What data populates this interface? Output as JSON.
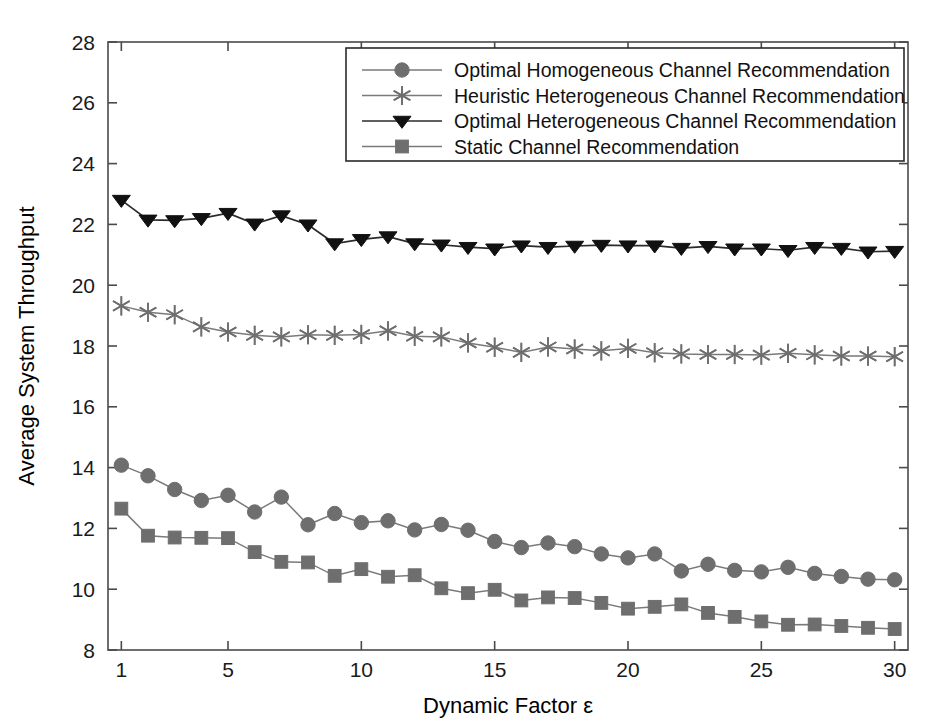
{
  "chart_data": {
    "type": "line",
    "title": "",
    "xlabel": "Dynamic Factor ε",
    "ylabel": "Average System Throughput",
    "xlim": [
      0.5,
      30.5
    ],
    "ylim": [
      8,
      28
    ],
    "xticks": [
      1,
      5,
      10,
      15,
      20,
      25,
      30
    ],
    "xticklabels": [
      "1",
      "5",
      "10",
      "15",
      "20",
      "25",
      "30"
    ],
    "yticks": [
      8,
      10,
      12,
      14,
      16,
      18,
      20,
      22,
      24,
      26,
      28
    ],
    "yticklabels": [
      "8",
      "10",
      "12",
      "14",
      "16",
      "18",
      "20",
      "22",
      "24",
      "26",
      "28"
    ],
    "grid": false,
    "legend_position": "upper center",
    "x": [
      1,
      2,
      3,
      4,
      5,
      6,
      7,
      8,
      9,
      10,
      11,
      12,
      13,
      14,
      15,
      16,
      17,
      18,
      19,
      20,
      21,
      22,
      23,
      24,
      25,
      26,
      27,
      28,
      29,
      30
    ],
    "series": [
      {
        "name": "Optimal Homogeneous Channel Recommendation",
        "marker": "circle",
        "marker_color": "#6e6e6e",
        "line_color": "#7a7a7a",
        "values": [
          14.08,
          13.73,
          13.28,
          12.92,
          13.09,
          12.54,
          13.03,
          12.12,
          12.49,
          12.19,
          12.25,
          11.95,
          12.13,
          11.94,
          11.57,
          11.37,
          11.52,
          11.4,
          11.16,
          11.03,
          11.16,
          10.6,
          10.82,
          10.62,
          10.57,
          10.72,
          10.52,
          10.42,
          10.33,
          10.31
        ]
      },
      {
        "name": "Heuristic Heterogeneous Channel Recommendation",
        "marker": "star",
        "marker_color": "#6e6e6e",
        "line_color": "#7a7a7a",
        "values": [
          19.32,
          19.11,
          19.03,
          18.63,
          18.46,
          18.35,
          18.3,
          18.37,
          18.35,
          18.38,
          18.5,
          18.32,
          18.3,
          18.1,
          17.96,
          17.79,
          17.97,
          17.9,
          17.84,
          17.92,
          17.78,
          17.74,
          17.72,
          17.72,
          17.7,
          17.76,
          17.71,
          17.67,
          17.67,
          17.65
        ]
      },
      {
        "name": "Optimal Heterogeneous Channel Recommendation",
        "marker": "triangle-down",
        "marker_color": "#111111",
        "line_color": "#2b2b2b",
        "values": [
          22.8,
          22.15,
          22.13,
          22.2,
          22.37,
          22.02,
          22.29,
          21.99,
          21.37,
          21.51,
          21.6,
          21.37,
          21.33,
          21.25,
          21.2,
          21.3,
          21.25,
          21.29,
          21.32,
          21.3,
          21.3,
          21.22,
          21.28,
          21.2,
          21.2,
          21.15,
          21.25,
          21.22,
          21.1,
          21.12
        ]
      },
      {
        "name": "Static Channel Recommendation",
        "marker": "square",
        "marker_color": "#6e6e6e",
        "line_color": "#7a7a7a",
        "values": [
          12.65,
          11.76,
          11.7,
          11.69,
          11.68,
          11.22,
          10.9,
          10.88,
          10.44,
          10.66,
          10.41,
          10.46,
          10.03,
          9.87,
          9.98,
          9.63,
          9.73,
          9.71,
          9.55,
          9.36,
          9.42,
          9.5,
          9.22,
          9.09,
          8.94,
          8.83,
          8.84,
          8.79,
          8.73,
          8.69
        ]
      }
    ]
  },
  "legend": {
    "items": [
      {
        "label": "Optimal Homogeneous Channel Recommendation",
        "marker": "circle"
      },
      {
        "label": "Heuristic Heterogeneous Channel Recommendation",
        "marker": "star"
      },
      {
        "label": "Optimal Heterogeneous Channel Recommendation",
        "marker": "triangle-down"
      },
      {
        "label": "Static Channel Recommendation",
        "marker": "square"
      }
    ]
  },
  "colors": {
    "grey_marker": "#6e6e6e",
    "grey_line": "#7a7a7a",
    "black_marker": "#111111",
    "axis": "#4a4a4a",
    "background": "#ffffff"
  }
}
